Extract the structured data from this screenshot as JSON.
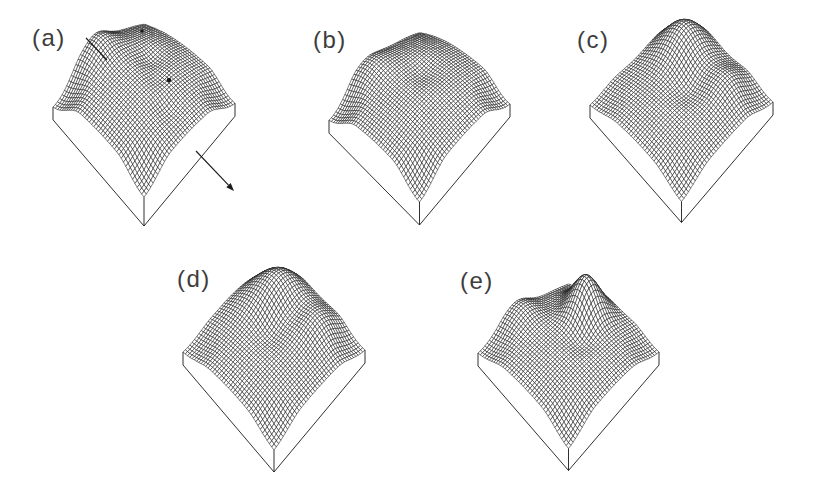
{
  "figure": {
    "background": "#ffffff",
    "ink": "#1a1a1a",
    "label_color": "#3d3d3d",
    "mesh_fill": "#ffffff",
    "mesh_stroke_width": 0.55,
    "box_stroke_width": 0.9
  },
  "chart_data": {
    "type": "surface",
    "title": "",
    "legend": null,
    "axes_visible": false,
    "grid_cells_per_side": 40,
    "depth_q": 0.42,
    "corner_falloff": 0.3,
    "masked_corners": [
      [
        1,
        0
      ],
      [
        0,
        1
      ],
      [
        1,
        1
      ]
    ],
    "panels": [
      {
        "id": "a",
        "label": "(a)",
        "label_pos": [
          32,
          24
        ],
        "geometry": {
          "cx": 144,
          "cyMid": 105,
          "halfW": 91,
          "Hf": 92,
          "K": 60,
          "sideWall": 13,
          "frontWall": 29,
          "tilt": -0.02
        },
        "bumps": [
          {
            "u": 0.5,
            "v": 0.5,
            "amp": 0.34,
            "sig": 0.6
          },
          {
            "u": 0.0,
            "v": 0.3,
            "amp": 0.22,
            "sig": 0.45
          },
          {
            "u": 0.04,
            "v": 0.55,
            "amp": 0.26,
            "sig": 0.13
          },
          {
            "u": 0.4,
            "v": 0.32,
            "amp": -0.1,
            "sig": 0.08
          },
          {
            "u": 0.55,
            "v": 0.42,
            "amp": -0.05,
            "sig": 0.06
          },
          {
            "u": 0.78,
            "v": 0.52,
            "amp": -0.06,
            "sig": 0.07
          }
        ],
        "annotations": {
          "leader": [
            86,
            38,
            107,
            60
          ],
          "arrow": [
            196,
            151,
            234,
            191
          ],
          "dots": [
            [
              169,
              80,
              2.3
            ],
            [
              142,
              31,
              1.7
            ]
          ]
        }
      },
      {
        "id": "b",
        "label": "(b)",
        "label_pos": [
          313,
          26
        ],
        "geometry": {
          "cx": 419.5,
          "cyMid": 112,
          "halfW": 90.5,
          "Hf": 90,
          "K": 60,
          "sideWall": 13,
          "frontWall": 23,
          "tilt": -0.09
        },
        "bumps": [
          {
            "u": 0.5,
            "v": 0.5,
            "amp": 0.36,
            "sig": 0.6
          },
          {
            "u": 0.1,
            "v": 0.15,
            "amp": 0.18,
            "sig": 0.4
          },
          {
            "u": 0.05,
            "v": 0.6,
            "amp": 0.18,
            "sig": 0.14
          },
          {
            "u": 0.42,
            "v": 0.38,
            "amp": -0.08,
            "sig": 0.09
          }
        ],
        "annotations": null
      },
      {
        "id": "c",
        "label": "(c)",
        "label_pos": [
          577,
          26
        ],
        "geometry": {
          "cx": 681.5,
          "cyMid": 103.5,
          "halfW": 91.5,
          "Hf": 98,
          "K": 52,
          "sideWall": 13,
          "frontWall": 21,
          "tilt": -0.016
        },
        "bumps": [
          {
            "u": 0.55,
            "v": 0.5,
            "amp": 0.26,
            "sig": 0.5
          },
          {
            "u": 0.22,
            "v": 0.19,
            "amp": 0.6,
            "sig": 0.17
          },
          {
            "u": 0.72,
            "v": 0.22,
            "amp": 0.22,
            "sig": 0.13
          },
          {
            "u": 0.52,
            "v": 0.45,
            "amp": -0.13,
            "sig": 0.1
          }
        ],
        "annotations": null
      },
      {
        "id": "d",
        "label": "(d)",
        "label_pos": [
          177,
          265
        ],
        "geometry": {
          "cx": 274,
          "cyMid": 351,
          "halfW": 91,
          "Hf": 99,
          "K": 50,
          "sideWall": 13,
          "frontWall": 22,
          "tilt": -0.011
        },
        "bumps": [
          {
            "u": 0.55,
            "v": 0.52,
            "amp": 0.28,
            "sig": 0.5
          },
          {
            "u": 0.25,
            "v": 0.2,
            "amp": 0.62,
            "sig": 0.19
          },
          {
            "u": 0.68,
            "v": 0.2,
            "amp": 0.28,
            "sig": 0.14
          },
          {
            "u": 0.5,
            "v": 0.28,
            "amp": -0.12,
            "sig": 0.09
          },
          {
            "u": 0.45,
            "v": 0.5,
            "amp": -0.12,
            "sig": 0.09
          },
          {
            "u": 0.08,
            "v": 0.5,
            "amp": 0.12,
            "sig": 0.16
          }
        ],
        "annotations": null
      },
      {
        "id": "e",
        "label": "(e)",
        "label_pos": [
          460,
          267
        ],
        "geometry": {
          "cx": 568.5,
          "cyMid": 352.5,
          "halfW": 90.5,
          "Hf": 96,
          "K": 50,
          "sideWall": 13,
          "frontWall": 22,
          "tilt": -0.006
        },
        "bumps": [
          {
            "u": 0.55,
            "v": 0.52,
            "amp": 0.3,
            "sig": 0.55
          },
          {
            "u": 0.42,
            "v": 0.22,
            "amp": 0.7,
            "sig": 0.115
          },
          {
            "u": 0.26,
            "v": 0.14,
            "amp": 0.18,
            "sig": 0.09
          },
          {
            "u": 0.05,
            "v": 0.58,
            "amp": 0.26,
            "sig": 0.13
          },
          {
            "u": 0.2,
            "v": 0.36,
            "amp": -0.06,
            "sig": 0.1
          },
          {
            "u": 0.58,
            "v": 0.44,
            "amp": -0.09,
            "sig": 0.08
          }
        ],
        "annotations": null
      }
    ]
  }
}
